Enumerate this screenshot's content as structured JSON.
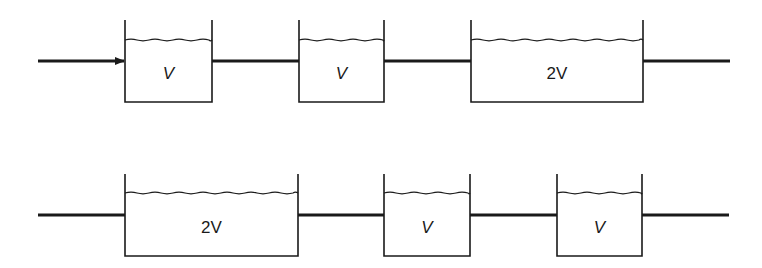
{
  "diagram": {
    "type": "tanks-in-series",
    "rows": [
      {
        "name": "configuration-a",
        "pipe_y": 61,
        "inlet": {
          "x1": 38,
          "x2": 124,
          "arrow": true
        },
        "tanks": [
          {
            "label": "V",
            "x1": 125,
            "x2": 212,
            "top": 20,
            "water": 40,
            "bottom": 102
          },
          {
            "label": "V",
            "x1": 299,
            "x2": 384,
            "top": 20,
            "water": 40,
            "bottom": 102
          },
          {
            "label": "2V",
            "x1": 471,
            "x2": 643,
            "top": 20,
            "water": 40,
            "bottom": 102
          }
        ],
        "outlet": {
          "x1": 643,
          "x2": 730
        }
      },
      {
        "name": "configuration-b",
        "pipe_y": 215,
        "inlet": {
          "x1": 38,
          "x2": 125,
          "arrow": false
        },
        "tanks": [
          {
            "label": "2V",
            "x1": 125,
            "x2": 298,
            "top": 174,
            "water": 193,
            "bottom": 256
          },
          {
            "label": "V",
            "x1": 384,
            "x2": 470,
            "top": 174,
            "water": 193,
            "bottom": 256
          },
          {
            "label": "V",
            "x1": 557,
            "x2": 642,
            "top": 174,
            "water": 193,
            "bottom": 256
          }
        ],
        "outlet": {
          "x1": 642,
          "x2": 729
        }
      }
    ]
  },
  "labels": {
    "row_a": [
      "V",
      "V",
      "2V"
    ],
    "row_b": [
      "2V",
      "V",
      "V"
    ]
  },
  "colors": {
    "ink": "#1a1a1a",
    "background": "#ffffff"
  }
}
